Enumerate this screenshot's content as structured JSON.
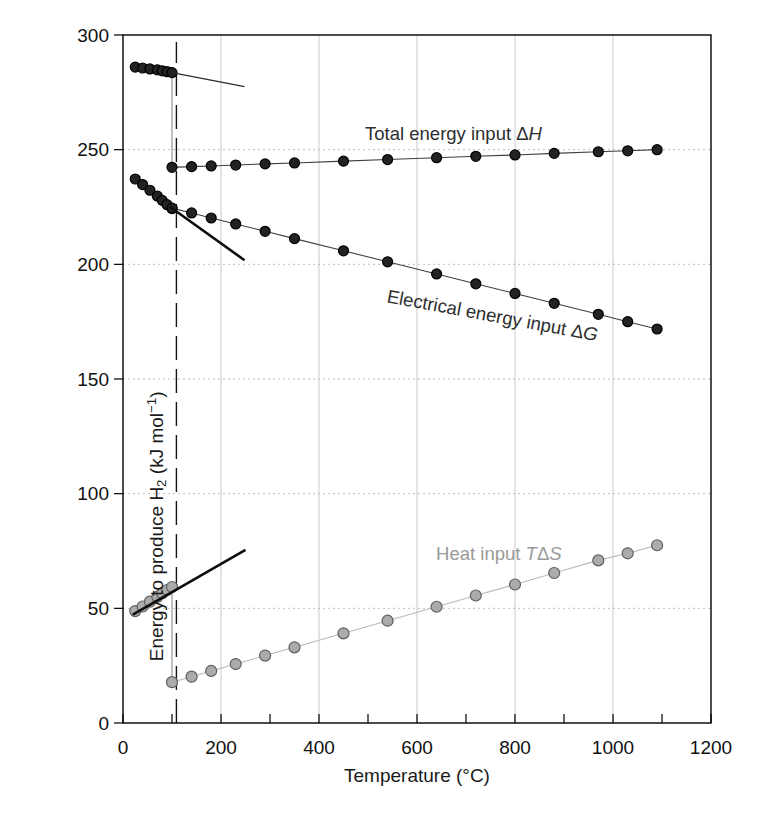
{
  "chart_data": {
    "type": "line",
    "title": "",
    "xlabel": "Temperature (°C)",
    "ylabel": "Energy to produce H2 (kJ mol−1)",
    "xlim": [
      0,
      1200
    ],
    "ylim": [
      0,
      300
    ],
    "grid": {
      "x": [
        200,
        400,
        600,
        800,
        1000
      ],
      "y": [
        50,
        100,
        150,
        200,
        250
      ]
    },
    "x_axis": {
      "label": "Temperature (°C)",
      "ticks_labeled": [
        0,
        200,
        400,
        600,
        800,
        1000,
        1200
      ],
      "ticks_minor": [
        100,
        300,
        500,
        700,
        900,
        1100
      ]
    },
    "y_axis": {
      "ticks": [
        0,
        50,
        100,
        150,
        200,
        250,
        300
      ],
      "label_parts": [
        {
          "t": "Energy to produce H"
        },
        {
          "t": "2",
          "sub": true
        },
        {
          "t": " (kJ mol"
        },
        {
          "t": "−1",
          "sup": true
        },
        {
          "t": ")"
        }
      ]
    },
    "colors": {
      "grid_vertical": "#c9c9c9",
      "grid_horizontal": "#bdbdbd",
      "frame": "#000000",
      "tick_text": "#111111",
      "dark_series": "#222222",
      "gray_series": "#a9a9a9",
      "gray_label": "#9a9a9a"
    },
    "marker_styles": {
      "dark": {
        "fill": "#222222",
        "stroke": "#000000",
        "r": 5,
        "line": "#3f3f3f",
        "lw": 1.1
      },
      "gray": {
        "fill": "#ababab",
        "stroke": "#5f5f5f",
        "r": 5.5,
        "line": "#b9b9b9",
        "lw": 1.1
      }
    },
    "series": [
      {
        "id": "dh-liquid",
        "name": "Total energy input ΔH (liquid water)",
        "marker": "dark",
        "points": [
          [
            25,
            286.0
          ],
          [
            40,
            285.6
          ],
          [
            55,
            285.2
          ],
          [
            70,
            284.8
          ],
          [
            80,
            284.4
          ],
          [
            90,
            284.0
          ],
          [
            100,
            283.6
          ]
        ]
      },
      {
        "id": "dh-steam",
        "name": "Total energy input ΔH (steam)",
        "marker": "dark",
        "points": [
          [
            100,
            242.3
          ],
          [
            140,
            242.6
          ],
          [
            180,
            242.9
          ],
          [
            230,
            243.3
          ],
          [
            290,
            243.8
          ],
          [
            350,
            244.2
          ],
          [
            450,
            245.0
          ],
          [
            540,
            245.7
          ],
          [
            640,
            246.5
          ],
          [
            720,
            247.1
          ],
          [
            800,
            247.7
          ],
          [
            880,
            248.4
          ],
          [
            970,
            249.1
          ],
          [
            1030,
            249.5
          ],
          [
            1090,
            250.0
          ]
        ]
      },
      {
        "id": "dg-liquid",
        "name": "Electrical energy input ΔG (liquid water)",
        "marker": "dark",
        "points": [
          [
            25,
            237.2
          ],
          [
            40,
            234.8
          ],
          [
            55,
            232.3
          ],
          [
            70,
            229.8
          ],
          [
            80,
            227.9
          ],
          [
            90,
            226.0
          ],
          [
            100,
            224.3
          ]
        ]
      },
      {
        "id": "dg-steam",
        "name": "Electrical energy input ΔG (steam)",
        "marker": "dark",
        "points": [
          [
            100,
            224.5
          ],
          [
            140,
            222.4
          ],
          [
            180,
            220.2
          ],
          [
            230,
            217.6
          ],
          [
            290,
            214.4
          ],
          [
            350,
            211.2
          ],
          [
            450,
            205.9
          ],
          [
            540,
            201.1
          ],
          [
            640,
            195.8
          ],
          [
            720,
            191.5
          ],
          [
            800,
            187.3
          ],
          [
            880,
            183.0
          ],
          [
            970,
            178.2
          ],
          [
            1030,
            175.0
          ],
          [
            1090,
            171.8
          ]
        ]
      },
      {
        "id": "tds-liquid",
        "name": "Heat input TΔS (liquid water)",
        "marker": "gray",
        "points": [
          [
            25,
            48.8
          ],
          [
            40,
            50.8
          ],
          [
            55,
            52.9
          ],
          [
            70,
            55.0
          ],
          [
            80,
            56.5
          ],
          [
            90,
            58.0
          ],
          [
            100,
            59.3
          ]
        ]
      },
      {
        "id": "tds-steam",
        "name": "Heat input TΔS (steam)",
        "marker": "gray",
        "points": [
          [
            100,
            17.8
          ],
          [
            140,
            20.2
          ],
          [
            180,
            22.7
          ],
          [
            230,
            25.7
          ],
          [
            290,
            29.4
          ],
          [
            350,
            33.0
          ],
          [
            450,
            39.1
          ],
          [
            540,
            44.6
          ],
          [
            640,
            50.7
          ],
          [
            720,
            55.6
          ],
          [
            800,
            60.4
          ],
          [
            880,
            65.4
          ],
          [
            970,
            70.9
          ],
          [
            1030,
            74.0
          ],
          [
            1090,
            77.5
          ]
        ]
      }
    ],
    "annotations": {
      "boiling_line": {
        "x": 109,
        "e0": 0,
        "e1": 297,
        "color": "#151515",
        "w": 1.4,
        "dash": "24 9"
      },
      "discontinuities": [
        {
          "x": 100,
          "e0": 283.6,
          "e1": 242.3
        },
        {
          "x": 100,
          "e0": 59.3,
          "e1": 17.8
        }
      ],
      "discontinuity_color": "#8a8a8a",
      "extrapolations": [
        {
          "from": [
            100,
            283.6
          ],
          "to": [
            248,
            277.5
          ],
          "w": 1.2,
          "color": "#2b2b2b"
        },
        {
          "from": [
            95,
            225.2
          ],
          "to": [
            248,
            201.8
          ],
          "w": 2.6,
          "color": "#0d0d0d"
        },
        {
          "from": [
            20,
            47.3
          ],
          "to": [
            250,
            75.5
          ],
          "w": 2.6,
          "color": "#0d0d0d"
        }
      ]
    },
    "curve_labels": [
      {
        "id": "dh",
        "anchor": [
          494,
          254
        ],
        "angle": 0,
        "color": "#2e2e2e",
        "parts": [
          {
            "t": "Total energy input "
          },
          {
            "t": "Δ"
          },
          {
            "t": "H",
            "i": true
          }
        ]
      },
      {
        "id": "dg",
        "anchor": [
          537,
          183.5
        ],
        "angle": 10.5,
        "color": "#2e2e2e",
        "parts": [
          {
            "t": "Electrical energy input "
          },
          {
            "t": "Δ"
          },
          {
            "t": "G",
            "i": true
          }
        ]
      },
      {
        "id": "tds",
        "anchor": [
          639,
          71
        ],
        "angle": 0,
        "color": "#9a9a9a",
        "parts": [
          {
            "t": "Heat input "
          },
          {
            "t": "T",
            "i": true
          },
          {
            "t": "Δ"
          },
          {
            "t": "S",
            "i": true
          }
        ]
      }
    ]
  }
}
